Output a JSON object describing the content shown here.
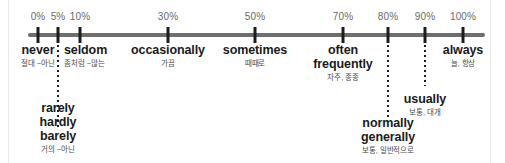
{
  "figure": {
    "axis": {
      "start_percent": 0,
      "end_percent": 100,
      "tick_color": "#1d1d1d",
      "line_color": "#6e6e6e"
    },
    "ticks": [
      {
        "label": "0%",
        "x": 38
      },
      {
        "label": "5%",
        "x": 58
      },
      {
        "label": "10%",
        "x": 80
      },
      {
        "label": "30%",
        "x": 168
      },
      {
        "label": "50%",
        "x": 255
      },
      {
        "label": "70%",
        "x": 343
      },
      {
        "label": "80%",
        "x": 388
      },
      {
        "label": "90%",
        "x": 425
      },
      {
        "label": "100%",
        "x": 463
      }
    ],
    "connectors": [
      {
        "x": 58,
        "top": 40,
        "height": 88
      },
      {
        "x": 388,
        "top": 40,
        "height": 78
      },
      {
        "x": 425,
        "top": 40,
        "height": 46
      }
    ],
    "terms": [
      {
        "id": "never",
        "english": "never",
        "korean": "절대 ~아닌",
        "x": 38,
        "y": 43,
        "align": "center",
        "percent": "0%"
      },
      {
        "id": "seldom",
        "english": "seldom",
        "korean": "좀처럼 ~않는",
        "x": 64,
        "y": 43,
        "align": "left",
        "percent": "5%"
      },
      {
        "id": "occasionally",
        "english": "occasionally",
        "korean": "가끔",
        "x": 168,
        "y": 43,
        "align": "center",
        "percent": "30%"
      },
      {
        "id": "sometimes",
        "english": "sometimes",
        "korean": "때때로",
        "x": 255,
        "y": 43,
        "align": "center",
        "percent": "50%"
      },
      {
        "id": "often-frequently",
        "english": "often\nfrequently",
        "korean": "자주, 종종",
        "x": 343,
        "y": 43,
        "align": "center",
        "percent": "70%"
      },
      {
        "id": "always",
        "english": "always",
        "korean": "늘, 항상",
        "x": 463,
        "y": 43,
        "align": "center",
        "percent": "100%"
      },
      {
        "id": "usually",
        "english": "usually",
        "korean": "보통, 대개",
        "x": 425,
        "y": 92,
        "align": "center",
        "percent": "90%"
      },
      {
        "id": "rarely-hardly-barely",
        "english": "rarely\nhardly\nbarely",
        "korean": "거의 ~아닌",
        "x": 58,
        "y": 101,
        "align": "center",
        "percent": "5%"
      },
      {
        "id": "normally-generally",
        "english": "normally\ngenerally",
        "korean": "보통, 일반적으로",
        "x": 388,
        "y": 116,
        "align": "center",
        "percent": "80%"
      }
    ]
  },
  "chart_data": {
    "type": "scatter",
    "xlabel": "",
    "ylabel": "",
    "xlim": [
      0,
      100
    ],
    "grid": false,
    "legend": "none",
    "tick_labels": [
      "0%",
      "5%",
      "10%",
      "30%",
      "50%",
      "70%",
      "80%",
      "90%",
      "100%"
    ],
    "x": [
      0,
      5,
      10,
      30,
      50,
      70,
      80,
      90,
      100
    ],
    "annotations": [
      {
        "x": 0,
        "label": "never",
        "sublabel": "절대 ~아닌"
      },
      {
        "x": 5,
        "label": "seldom",
        "sublabel": "좀처럼 ~않는"
      },
      {
        "x": 5,
        "label": "rarely / hardly / barely",
        "sublabel": "거의 ~아닌"
      },
      {
        "x": 30,
        "label": "occasionally",
        "sublabel": "가끔"
      },
      {
        "x": 50,
        "label": "sometimes",
        "sublabel": "때때로"
      },
      {
        "x": 70,
        "label": "often / frequently",
        "sublabel": "자주, 종종"
      },
      {
        "x": 80,
        "label": "normally / generally",
        "sublabel": "보통, 일반적으로"
      },
      {
        "x": 90,
        "label": "usually",
        "sublabel": "보통, 대개"
      },
      {
        "x": 100,
        "label": "always",
        "sublabel": "늘, 항상"
      }
    ]
  }
}
